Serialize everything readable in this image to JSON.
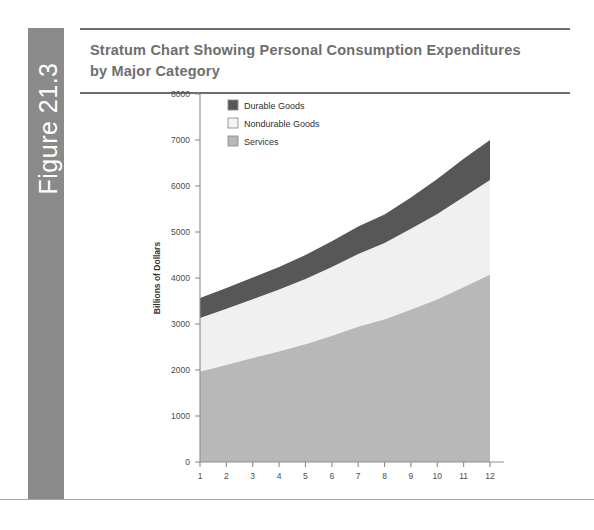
{
  "figure": {
    "tab_label": "Figure 21.3",
    "tab_color": "#8a8a8a",
    "title": "Stratum Chart Showing Personal Consumption Expenditures by Major Category",
    "title_line1": "Stratum Chart Showing Personal Consumption Expenditures",
    "title_line2": "by Major Category",
    "title_color": "#6e6e6e",
    "rule_color": "#6d6d6d"
  },
  "chart_data": {
    "type": "area",
    "title": "Stratum Chart Showing Personal Consumption Expenditures by Major Category",
    "subtitle": "",
    "stacked": true,
    "xlabel": "",
    "ylabel": "Billions of Dollars",
    "x": [
      1,
      2,
      3,
      4,
      5,
      6,
      7,
      8,
      9,
      10,
      11,
      12
    ],
    "categories": [
      "1",
      "2",
      "3",
      "4",
      "5",
      "6",
      "7",
      "8",
      "9",
      "10",
      "11",
      "12"
    ],
    "xlim": [
      1,
      12
    ],
    "ylim": [
      0,
      8000
    ],
    "yticks": [
      0,
      1000,
      2000,
      3000,
      4000,
      5000,
      6000,
      7000,
      8000
    ],
    "xticks": [
      1,
      2,
      3,
      4,
      5,
      6,
      7,
      8,
      9,
      10,
      11,
      12
    ],
    "ytick_labels": [
      "0",
      "1000",
      "2000",
      "3000",
      "4000",
      "5000",
      "6000",
      "7000",
      "8000"
    ],
    "xtick_labels": [
      "1",
      "2",
      "3",
      "4",
      "5",
      "6",
      "7",
      "8",
      "9",
      "10",
      "11",
      "12"
    ],
    "grid": false,
    "legend_position": "upper left",
    "stack_order_bottom_to_top": [
      "Services",
      "Nondurable Goods",
      "Durable Goods"
    ],
    "series": [
      {
        "name": "Services",
        "color": "#b8b8b8",
        "values": [
          1960,
          2110,
          2260,
          2400,
          2560,
          2740,
          2940,
          3100,
          3310,
          3530,
          3800,
          4070
        ],
        "cumulative_top": [
          1960,
          2110,
          2260,
          2400,
          2560,
          2740,
          2940,
          3100,
          3310,
          3530,
          3800,
          4070
        ]
      },
      {
        "name": "Nondurable Goods",
        "color": "#f0f0f0",
        "values": [
          1170,
          1220,
          1280,
          1350,
          1420,
          1500,
          1580,
          1660,
          1760,
          1860,
          1960,
          2060
        ],
        "cumulative_top": [
          3130,
          3330,
          3540,
          3750,
          3980,
          4240,
          4520,
          4760,
          5070,
          5390,
          5760,
          6130
        ]
      },
      {
        "name": "Durable Goods",
        "color": "#575757",
        "values": [
          435,
          450,
          470,
          490,
          520,
          560,
          600,
          620,
          680,
          760,
          830,
          870
        ],
        "cumulative_top": [
          3565,
          3780,
          4010,
          4240,
          4500,
          4800,
          5120,
          5380,
          5750,
          6150,
          6590,
          7000
        ]
      }
    ],
    "totals": [
      3565,
      3780,
      4010,
      4240,
      4500,
      4800,
      5120,
      5380,
      5750,
      6150,
      6590,
      7000
    ],
    "legend": [
      {
        "label": "Durable Goods",
        "color": "#575757"
      },
      {
        "label": "Nondurable Goods",
        "color": "#f4f4f4"
      },
      {
        "label": "Services",
        "color": "#b8b8b8"
      }
    ],
    "axis_color": "#8d8d8d"
  }
}
